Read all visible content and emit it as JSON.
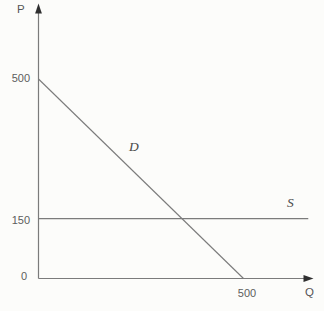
{
  "figure": {
    "axis_labels": {
      "y": "P",
      "x": "Q"
    },
    "colors": {
      "background": "#fcfcfa",
      "line": "#7b7b7b",
      "axis": "#7b7b7b",
      "arrowhead": "#2f2f2f",
      "text": "#5d5d5d"
    }
  },
  "chart_data": {
    "type": "line",
    "title": "",
    "xlabel": "Q",
    "ylabel": "P",
    "xlim": [
      0,
      670
    ],
    "ylim": [
      0,
      680
    ],
    "grid": false,
    "legend": "none",
    "origin_label": "0",
    "y_ticks": [
      {
        "label": "500",
        "value": 500
      },
      {
        "label": "150",
        "value": 150
      }
    ],
    "x_ticks": [
      {
        "label": "500",
        "value": 500
      }
    ],
    "series": [
      {
        "name": "D",
        "role": "demand",
        "points": [
          [
            0,
            500
          ],
          [
            500,
            0
          ]
        ]
      },
      {
        "name": "S",
        "role": "supply",
        "points": [
          [
            0,
            150
          ],
          [
            658,
            150
          ]
        ]
      }
    ],
    "intersection_note": "D crosses S at approximately Q=350, P=150"
  }
}
